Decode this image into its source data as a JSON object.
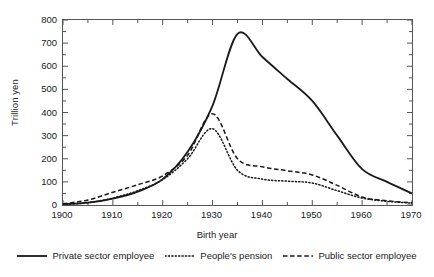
{
  "chart_data": {
    "type": "line",
    "title": "",
    "xlabel": "Birth year",
    "ylabel": "Trillion yen",
    "xlim": [
      1900,
      1970
    ],
    "ylim": [
      0,
      800
    ],
    "grid": false,
    "legend_position": "bottom",
    "xticks": [
      1900,
      1910,
      1920,
      1930,
      1940,
      1950,
      1960,
      1970
    ],
    "yticks": [
      0,
      100,
      200,
      300,
      400,
      500,
      600,
      700,
      800
    ],
    "x": [
      1900,
      1905,
      1910,
      1915,
      1920,
      1925,
      1930,
      1935,
      1940,
      1945,
      1950,
      1955,
      1960,
      1965,
      1970
    ],
    "series": [
      {
        "name": "Private sector employee",
        "style": "solid",
        "color": "#1a1a1a",
        "values": [
          4,
          10,
          28,
          58,
          112,
          230,
          430,
          740,
          640,
          545,
          450,
          300,
          155,
          100,
          50
        ]
      },
      {
        "name": "People's pension",
        "style": "dotted",
        "color": "#1a1a1a",
        "values": [
          2,
          10,
          30,
          62,
          110,
          200,
          330,
          150,
          112,
          103,
          95,
          62,
          30,
          16,
          8
        ]
      },
      {
        "name": "Public sector employee",
        "style": "dashed",
        "color": "#1a1a1a",
        "values": [
          5,
          22,
          55,
          88,
          126,
          215,
          395,
          200,
          165,
          148,
          130,
          85,
          35,
          18,
          10
        ]
      }
    ]
  },
  "legend": {
    "items": [
      {
        "label": "Private sector employee",
        "style": "solid"
      },
      {
        "label": "People's pension",
        "style": "dotted"
      },
      {
        "label": "Public sector employee",
        "style": "dashed"
      }
    ]
  }
}
